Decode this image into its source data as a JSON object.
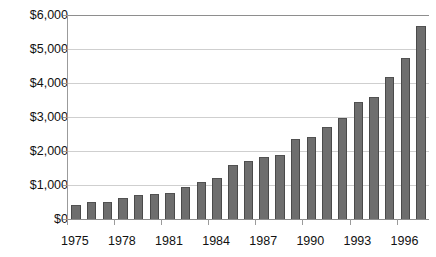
{
  "chart_data": {
    "type": "bar",
    "title": "",
    "xlabel": "",
    "ylabel": "",
    "ylim": [
      0,
      6000
    ],
    "ytick_labels": [
      "$6,000",
      "$5,000",
      "$4,000",
      "$3,000",
      "$2,000",
      "$1,000",
      "$0"
    ],
    "ytick_values": [
      6000,
      5000,
      4000,
      3000,
      2000,
      1000,
      0
    ],
    "xtick_labels": [
      "1975",
      "1978",
      "1981",
      "1984",
      "1987",
      "1990",
      "1993",
      "1996"
    ],
    "grid": true,
    "legend": "none",
    "bar_color": "#6e6e6e",
    "categories": [
      "1975",
      "1976",
      "1977",
      "1978",
      "1979",
      "1980",
      "1981",
      "1982",
      "1983",
      "1984",
      "1985",
      "1986",
      "1987",
      "1988",
      "1989",
      "1990",
      "1991",
      "1992",
      "1993",
      "1994",
      "1995",
      "1996",
      "1997"
    ],
    "values": [
      400,
      490,
      510,
      610,
      720,
      750,
      770,
      930,
      1100,
      1210,
      1590,
      1720,
      1820,
      1870,
      2350,
      2410,
      2700,
      2980,
      3440,
      3580,
      4170,
      4750,
      5670
    ],
    "series": [
      {
        "name": "value",
        "values": [
          400,
          490,
          510,
          610,
          720,
          750,
          770,
          930,
          1100,
          1210,
          1590,
          1720,
          1820,
          1870,
          2350,
          2410,
          2700,
          2980,
          3440,
          3580,
          4170,
          4750,
          5670
        ]
      }
    ]
  }
}
